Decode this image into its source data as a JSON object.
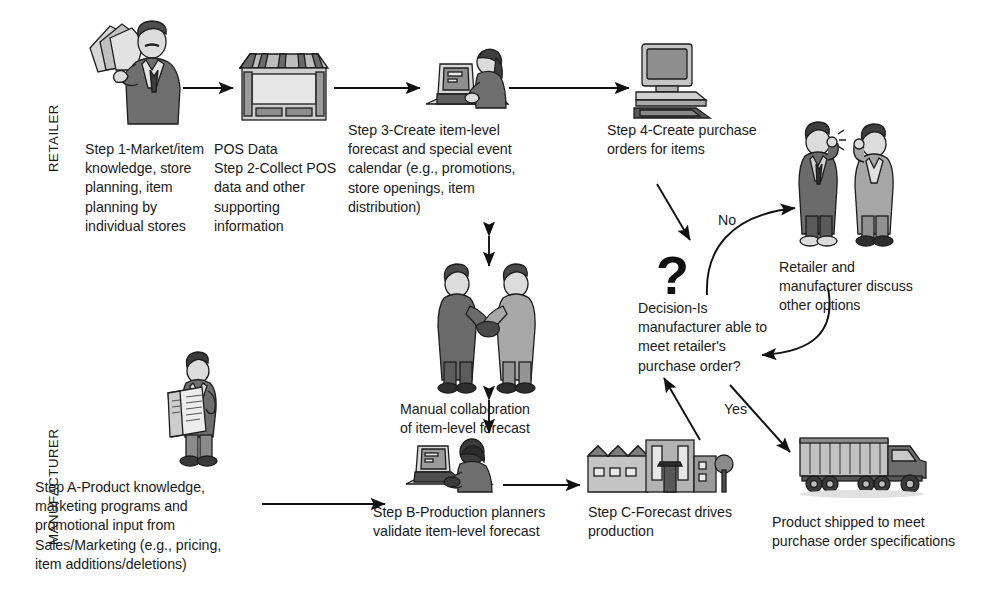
{
  "diagram": {
    "swimlanes": [
      {
        "id": "retailer",
        "label": "RETAILER"
      },
      {
        "id": "manufacturer",
        "label": "MANUFACTURER"
      }
    ],
    "decision_symbol": "?",
    "edge_labels": {
      "no": "No",
      "yes": "Yes"
    },
    "nodes": [
      {
        "id": "step1",
        "lane": "retailer",
        "icon": "businessman-with-documents-icon",
        "caption": "Step 1-Market/item\nknowledge, store\nplanning, item\nplanning by\nindividual stores"
      },
      {
        "id": "step2",
        "lane": "retailer",
        "icon": "retail-store-icon",
        "caption": "POS Data\nStep 2-Collect POS\ndata and other\nsupporting\ninformation"
      },
      {
        "id": "step3",
        "lane": "retailer",
        "icon": "person-at-laptop-icon",
        "caption": "Step 3-Create item-level\nforecast and special event\ncalendar (e.g., promotions,\nstore openings, item\ndistribution)"
      },
      {
        "id": "step4",
        "lane": "retailer",
        "icon": "desktop-computer-icon",
        "caption": "Step 4-Create purchase\norders for items"
      },
      {
        "id": "collaboration",
        "lane": "shared",
        "icon": "handshake-two-people-icon",
        "caption": "Manual collaboration\nof item-level forecast"
      },
      {
        "id": "decision",
        "lane": "shared",
        "icon": "question-mark-icon",
        "caption": "Decision-Is\nmanufacturer able to\nmeet retailer's\npurchase order?"
      },
      {
        "id": "discuss",
        "lane": "shared",
        "icon": "two-people-on-phones-icon",
        "caption": "Retailer and\nmanufacturer discuss\nother options"
      },
      {
        "id": "stepA",
        "lane": "manufacturer",
        "icon": "man-reading-newspaper-icon",
        "caption": "Step A-Product knowledge,\nmarketing programs and\npromotional input from\nSales/Marketing (e.g., pricing,\nitem additions/deletions)"
      },
      {
        "id": "stepB",
        "lane": "manufacturer",
        "icon": "production-planner-at-laptop-icon",
        "caption": "Step B-Production planners\nvalidate item-level forecast"
      },
      {
        "id": "stepC",
        "lane": "manufacturer",
        "icon": "factory-icon",
        "caption": "Step C-Forecast drives\nproduction"
      },
      {
        "id": "shipping",
        "lane": "manufacturer",
        "icon": "delivery-truck-icon",
        "caption": "Product shipped to meet\npurchase order specifications"
      }
    ],
    "colors": {
      "ink": "#1a1a1a",
      "line": "#111111",
      "art_dark": "#555555",
      "art_mid": "#8d8d8d",
      "art_light": "#c9c9c9",
      "background": "#ffffff"
    }
  }
}
